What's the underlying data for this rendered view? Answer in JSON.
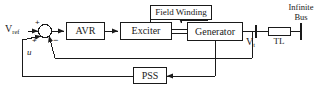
{
  "diagram": {
    "colors": {
      "line": "#1a1a1a",
      "box_fill": "#ffffff",
      "box_stroke": "#1a1a1a",
      "background": "#ffffff",
      "text": "#1a1a1a"
    },
    "blocks": {
      "avr": "AVR",
      "exciter": "Exciter",
      "generator": "Generator",
      "field_winding": "Field Winding",
      "pss": "PSS",
      "tl": "TL"
    },
    "labels": {
      "v_ref": "V",
      "v_ref_sub": "ref",
      "u": "u",
      "v_t": "V",
      "v_t_sub": "t",
      "infinite_bus_line1": "Infinite",
      "infinite_bus_line2": "Bus"
    },
    "signs": {
      "top_plus": "+",
      "bottom_plus": "+",
      "minus": "−"
    },
    "icons": {
      "summing_junction": "summing-junction-circle",
      "arrow": "arrowhead",
      "bus_terminal": "bus-terminal-bar"
    }
  }
}
